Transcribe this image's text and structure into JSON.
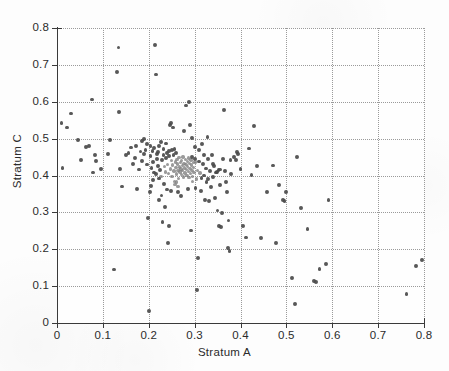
{
  "figure": {
    "width": 449,
    "height": 371,
    "background_color": "#fdfdfd",
    "point_color": "#7d7d7d",
    "point_color_dark": "#4a4a4a",
    "grid_color": "#9a9a9a",
    "axis_color": "#3a3a3a"
  },
  "axes": {
    "x_tick_labels": [
      "0",
      "0.1",
      "0.2",
      "0.3",
      "0.4",
      "0.5",
      "0.6",
      "0.7",
      "0.8"
    ],
    "y_tick_labels": [
      "0",
      "0.1",
      "0.2",
      "0.3",
      "0.4",
      "0.5",
      "0.6",
      "0.7",
      "0.8"
    ],
    "x_tick_values": [
      0,
      0.1,
      0.2,
      0.3,
      0.4,
      0.5,
      0.6,
      0.7,
      0.8
    ],
    "y_tick_values": [
      0,
      0.1,
      0.2,
      0.3,
      0.4,
      0.5,
      0.6,
      0.7,
      0.8
    ]
  },
  "chart_data": {
    "type": "scatter",
    "title": "",
    "subtitle": "",
    "xlabel": "Stratum A",
    "ylabel": "Stratum C",
    "xlim": [
      0,
      0.8
    ],
    "ylim": [
      0,
      0.8
    ],
    "grid": true,
    "grid_style": "dotted",
    "legend": null,
    "legend_position": "none",
    "marker": "dot",
    "marker_color": "#7d7d7d",
    "marker_size": 3,
    "n_points": 224,
    "annotations": [],
    "cluster_center": [
      0.27,
      0.41
    ],
    "points": [
      [
        0.01,
        0.543
      ],
      [
        0.012,
        0.42
      ],
      [
        0.022,
        0.53
      ],
      [
        0.03,
        0.568
      ],
      [
        0.046,
        0.496
      ],
      [
        0.052,
        0.441
      ],
      [
        0.063,
        0.478
      ],
      [
        0.07,
        0.481
      ],
      [
        0.076,
        0.606
      ],
      [
        0.079,
        0.408
      ],
      [
        0.082,
        0.456
      ],
      [
        0.085,
        0.44
      ],
      [
        0.096,
        0.417
      ],
      [
        0.112,
        0.459
      ],
      [
        0.116,
        0.496
      ],
      [
        0.124,
        0.145
      ],
      [
        0.131,
        0.681
      ],
      [
        0.134,
        0.747
      ],
      [
        0.136,
        0.573
      ],
      [
        0.138,
        0.418
      ],
      [
        0.142,
        0.37
      ],
      [
        0.15,
        0.455
      ],
      [
        0.156,
        0.462
      ],
      [
        0.162,
        0.476
      ],
      [
        0.166,
        0.432
      ],
      [
        0.17,
        0.447
      ],
      [
        0.172,
        0.48
      ],
      [
        0.175,
        0.364
      ],
      [
        0.178,
        0.416
      ],
      [
        0.182,
        0.465
      ],
      [
        0.186,
        0.44
      ],
      [
        0.19,
        0.458
      ],
      [
        0.193,
        0.47
      ],
      [
        0.196,
        0.43
      ],
      [
        0.198,
        0.285
      ],
      [
        0.2,
        0.033
      ],
      [
        0.202,
        0.355
      ],
      [
        0.204,
        0.452
      ],
      [
        0.206,
        0.42
      ],
      [
        0.208,
        0.467
      ],
      [
        0.21,
        0.437
      ],
      [
        0.212,
        0.408
      ],
      [
        0.214,
        0.754
      ],
      [
        0.216,
        0.674
      ],
      [
        0.218,
        0.445
      ],
      [
        0.22,
        0.463
      ],
      [
        0.221,
        0.425
      ],
      [
        0.223,
        0.48
      ],
      [
        0.225,
        0.415
      ],
      [
        0.227,
        0.398
      ],
      [
        0.229,
        0.442
      ],
      [
        0.23,
        0.274
      ],
      [
        0.232,
        0.456
      ],
      [
        0.234,
        0.424
      ],
      [
        0.236,
        0.41
      ],
      [
        0.238,
        0.447
      ],
      [
        0.24,
        0.462
      ],
      [
        0.241,
        0.43
      ],
      [
        0.243,
        0.405
      ],
      [
        0.245,
        0.452
      ],
      [
        0.246,
        0.536
      ],
      [
        0.247,
        0.418
      ],
      [
        0.249,
        0.44
      ],
      [
        0.25,
        0.47
      ],
      [
        0.251,
        0.398
      ],
      [
        0.252,
        0.428
      ],
      [
        0.254,
        0.455
      ],
      [
        0.255,
        0.412
      ],
      [
        0.256,
        0.384
      ],
      [
        0.258,
        0.437
      ],
      [
        0.259,
        0.421
      ],
      [
        0.26,
        0.46
      ],
      [
        0.261,
        0.404
      ],
      [
        0.262,
        0.444
      ],
      [
        0.263,
        0.431
      ],
      [
        0.264,
        0.414
      ],
      [
        0.265,
        0.392
      ],
      [
        0.266,
        0.448
      ],
      [
        0.267,
        0.423
      ],
      [
        0.268,
        0.409
      ],
      [
        0.269,
        0.436
      ],
      [
        0.27,
        0.418
      ],
      [
        0.271,
        0.402
      ],
      [
        0.272,
        0.441
      ],
      [
        0.273,
        0.427
      ],
      [
        0.274,
        0.413
      ],
      [
        0.275,
        0.45
      ],
      [
        0.276,
        0.396
      ],
      [
        0.277,
        0.433
      ],
      [
        0.278,
        0.42
      ],
      [
        0.279,
        0.407
      ],
      [
        0.28,
        0.443
      ],
      [
        0.281,
        0.429
      ],
      [
        0.282,
        0.416
      ],
      [
        0.283,
        0.4
      ],
      [
        0.284,
        0.438
      ],
      [
        0.285,
        0.424
      ],
      [
        0.286,
        0.411
      ],
      [
        0.287,
        0.447
      ],
      [
        0.288,
        0.394
      ],
      [
        0.289,
        0.432
      ],
      [
        0.29,
        0.419
      ],
      [
        0.291,
        0.405
      ],
      [
        0.292,
        0.442
      ],
      [
        0.293,
        0.428
      ],
      [
        0.294,
        0.414
      ],
      [
        0.295,
        0.451
      ],
      [
        0.296,
        0.398
      ],
      [
        0.297,
        0.435
      ],
      [
        0.298,
        0.422
      ],
      [
        0.299,
        0.408
      ],
      [
        0.3,
        0.445
      ],
      [
        0.236,
        0.314
      ],
      [
        0.242,
        0.216
      ],
      [
        0.244,
        0.262
      ],
      [
        0.248,
        0.543
      ],
      [
        0.253,
        0.53
      ],
      [
        0.257,
        0.376
      ],
      [
        0.264,
        0.37
      ],
      [
        0.27,
        0.345
      ],
      [
        0.276,
        0.52
      ],
      [
        0.282,
        0.59
      ],
      [
        0.285,
        0.363
      ],
      [
        0.288,
        0.599
      ],
      [
        0.29,
        0.536
      ],
      [
        0.292,
        0.251
      ],
      [
        0.294,
        0.502
      ],
      [
        0.296,
        0.383
      ],
      [
        0.3,
        0.478
      ],
      [
        0.302,
        0.366
      ],
      [
        0.305,
        0.089
      ],
      [
        0.308,
        0.176
      ],
      [
        0.31,
        0.47
      ],
      [
        0.312,
        0.407
      ],
      [
        0.314,
        0.358
      ],
      [
        0.316,
        0.486
      ],
      [
        0.318,
        0.432
      ],
      [
        0.32,
        0.4
      ],
      [
        0.322,
        0.334
      ],
      [
        0.324,
        0.419
      ],
      [
        0.326,
        0.383
      ],
      [
        0.328,
        0.504
      ],
      [
        0.33,
        0.445
      ],
      [
        0.332,
        0.33
      ],
      [
        0.334,
        0.412
      ],
      [
        0.336,
        0.368
      ],
      [
        0.338,
        0.455
      ],
      [
        0.34,
        0.397
      ],
      [
        0.342,
        0.426
      ],
      [
        0.344,
        0.34
      ],
      [
        0.346,
        0.408
      ],
      [
        0.35,
        0.305
      ],
      [
        0.352,
        0.414
      ],
      [
        0.354,
        0.262
      ],
      [
        0.356,
        0.374
      ],
      [
        0.358,
        0.26
      ],
      [
        0.36,
        0.298
      ],
      [
        0.362,
        0.445
      ],
      [
        0.364,
        0.577
      ],
      [
        0.366,
        0.412
      ],
      [
        0.368,
        0.382
      ],
      [
        0.37,
        0.355
      ],
      [
        0.372,
        0.204
      ],
      [
        0.374,
        0.278
      ],
      [
        0.376,
        0.196
      ],
      [
        0.378,
        0.442
      ],
      [
        0.38,
        0.403
      ],
      [
        0.386,
        0.45
      ],
      [
        0.39,
        0.443
      ],
      [
        0.392,
        0.463
      ],
      [
        0.394,
        0.458
      ],
      [
        0.4,
        0.418
      ],
      [
        0.406,
        0.262
      ],
      [
        0.412,
        0.232
      ],
      [
        0.418,
        0.473
      ],
      [
        0.424,
        0.402
      ],
      [
        0.43,
        0.535
      ],
      [
        0.436,
        0.426
      ],
      [
        0.444,
        0.231
      ],
      [
        0.458,
        0.356
      ],
      [
        0.47,
        0.427
      ],
      [
        0.478,
        0.216
      ],
      [
        0.484,
        0.374
      ],
      [
        0.492,
        0.334
      ],
      [
        0.496,
        0.33
      ],
      [
        0.5,
        0.356
      ],
      [
        0.512,
        0.123
      ],
      [
        0.518,
        0.051
      ],
      [
        0.524,
        0.45
      ],
      [
        0.532,
        0.311
      ],
      [
        0.546,
        0.254
      ],
      [
        0.56,
        0.113
      ],
      [
        0.564,
        0.112
      ],
      [
        0.572,
        0.147
      ],
      [
        0.586,
        0.16
      ],
      [
        0.592,
        0.334
      ],
      [
        0.762,
        0.078
      ],
      [
        0.782,
        0.154
      ],
      [
        0.796,
        0.17
      ],
      [
        0.186,
        0.494
      ],
      [
        0.19,
        0.498
      ],
      [
        0.196,
        0.486
      ],
      [
        0.204,
        0.481
      ],
      [
        0.212,
        0.475
      ],
      [
        0.218,
        0.459
      ],
      [
        0.226,
        0.491
      ],
      [
        0.232,
        0.472
      ],
      [
        0.238,
        0.487
      ],
      [
        0.244,
        0.466
      ],
      [
        0.302,
        0.437
      ],
      [
        0.304,
        0.391
      ],
      [
        0.256,
        0.471
      ],
      [
        0.26,
        0.382
      ],
      [
        0.264,
        0.355
      ],
      [
        0.248,
        0.358
      ],
      [
        0.222,
        0.392
      ],
      [
        0.216,
        0.404
      ],
      [
        0.21,
        0.388
      ],
      [
        0.205,
        0.372
      ],
      [
        0.234,
        0.376
      ],
      [
        0.24,
        0.362
      ],
      [
        0.228,
        0.346
      ],
      [
        0.222,
        0.334
      ],
      [
        0.306,
        0.414
      ],
      [
        0.31,
        0.438
      ],
      [
        0.315,
        0.394
      ],
      [
        0.32,
        0.455
      ],
      [
        0.33,
        0.39
      ],
      [
        0.34,
        0.432
      ],
      [
        0.348,
        0.41
      ],
      [
        0.356,
        0.416
      ]
    ]
  }
}
